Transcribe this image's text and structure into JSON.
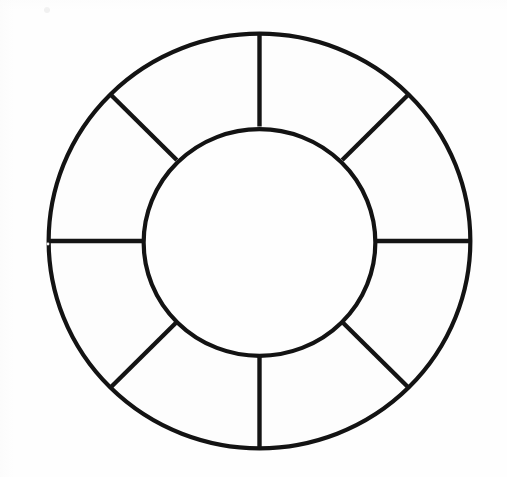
{
  "document": {
    "title": "Annulus Divided Into Eight Sectors",
    "kind": "line-drawing",
    "description": "Black outline drawing of a circular ring (annulus) divided into eight equal sectors by radial spokes",
    "background_color": "#fefefe",
    "ink_color": "#131313"
  },
  "figure": {
    "name": "eight-sector-annulus",
    "center": {
      "x": 259.5,
      "y": 241.0
    },
    "outer_radius": {
      "x": 213.0,
      "y": 209.5
    },
    "inner_radius": {
      "x": 118.0,
      "y": 115.5
    },
    "sector_count": 8,
    "sector_angle_degrees": 45,
    "stroke_width_px": 4.3,
    "spoke_angles_degrees": [
      0,
      45,
      90,
      135,
      180,
      225,
      270,
      315
    ],
    "spoke_labels": [
      "spoke-right-0deg",
      "spoke-upper-right-45deg",
      "spoke-top-90deg",
      "spoke-upper-left-135deg",
      "spoke-left-180deg",
      "spoke-lower-left-225deg",
      "spoke-bottom-270deg",
      "spoke-lower-right-315deg"
    ],
    "outer_extents": {
      "left_x": 46,
      "right_x": 473,
      "top_y": 31,
      "bottom_y": 450
    },
    "inner_extents": {
      "left_x": 141,
      "right_x": 377,
      "top_y": 127,
      "bottom_y": 358
    }
  },
  "chart_data": {
    "type": "pie",
    "title": "",
    "subtitle": "",
    "xlabel": "",
    "ylabel": "",
    "legend_position": "none",
    "grid": false,
    "donut": true,
    "inner_radius_ratio": 0.554,
    "categories": [
      "Sector 1",
      "Sector 2",
      "Sector 3",
      "Sector 4",
      "Sector 5",
      "Sector 6",
      "Sector 7",
      "Sector 8"
    ],
    "values": [
      45,
      45,
      45,
      45,
      45,
      45,
      45,
      45
    ],
    "value_unit": "degrees",
    "percentages": [
      12.5,
      12.5,
      12.5,
      12.5,
      12.5,
      12.5,
      12.5,
      12.5
    ],
    "slice_fill_colors": [
      "#ffffff",
      "#ffffff",
      "#ffffff",
      "#ffffff",
      "#ffffff",
      "#ffffff",
      "#ffffff",
      "#ffffff"
    ],
    "slice_stroke_color": "#131313",
    "annotations": []
  },
  "artifacts": {
    "speck_label": "scan-speck",
    "specks": [
      {
        "x": 47,
        "y": 10,
        "r": 3.0
      },
      {
        "x": 48,
        "y": 244,
        "r": 1.4
      }
    ]
  }
}
